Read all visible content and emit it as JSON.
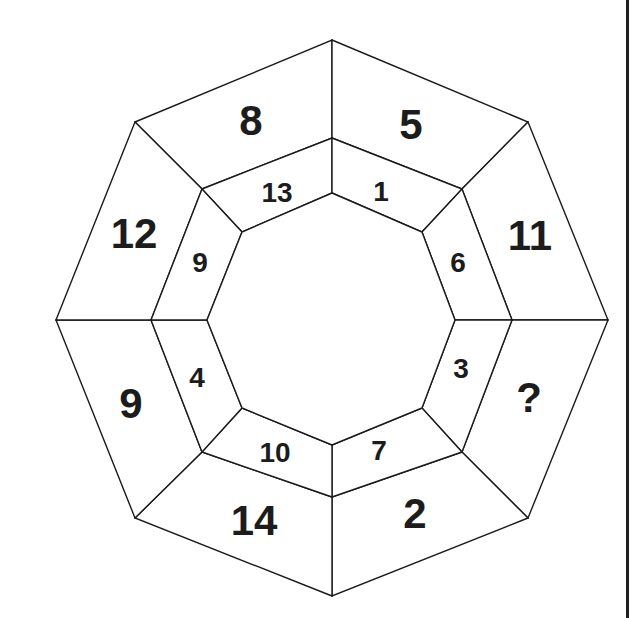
{
  "puzzle": {
    "shape": "octagon",
    "outer_ring": [
      {
        "position": "top-left",
        "value": "8"
      },
      {
        "position": "top-right",
        "value": "5"
      },
      {
        "position": "right-upper",
        "value": "11"
      },
      {
        "position": "right-lower",
        "value": "?"
      },
      {
        "position": "bottom-right",
        "value": "2"
      },
      {
        "position": "bottom-left",
        "value": "14"
      },
      {
        "position": "left-lower",
        "value": "9"
      },
      {
        "position": "left-upper",
        "value": "12"
      }
    ],
    "inner_ring": [
      {
        "position": "top-left",
        "value": "13"
      },
      {
        "position": "top-right",
        "value": "1"
      },
      {
        "position": "right-upper",
        "value": "6"
      },
      {
        "position": "right-lower",
        "value": "3"
      },
      {
        "position": "bottom-right",
        "value": "7"
      },
      {
        "position": "bottom-left",
        "value": "10"
      },
      {
        "position": "left-lower",
        "value": "4"
      },
      {
        "position": "left-upper",
        "value": "9"
      }
    ],
    "colors": {
      "line": "#1a1a1a",
      "text": "#1c1c1c",
      "background": "#ffffff"
    }
  }
}
